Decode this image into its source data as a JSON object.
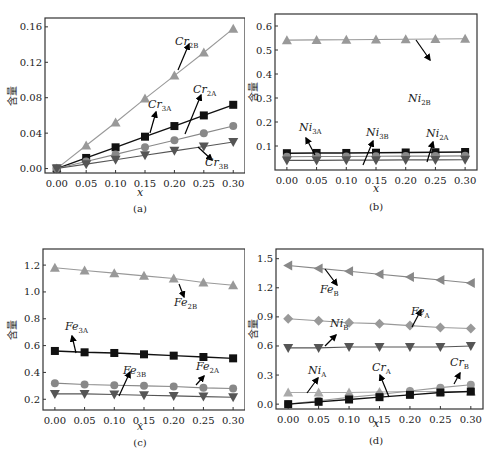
{
  "chart_data": [
    {
      "panel": "(a)",
      "type": "line",
      "xlabel": "x",
      "ylabel": "含量",
      "x": [
        0.0,
        0.05,
        0.1,
        0.15,
        0.2,
        0.25,
        0.3
      ],
      "ylim": [
        -0.005,
        0.17
      ],
      "yticks": [
        0.0,
        0.04,
        0.08,
        0.12,
        0.16
      ],
      "series": [
        {
          "name": "Cr2B",
          "marker": "triangle-up",
          "color": "#999999",
          "values": [
            0.0,
            0.026,
            0.052,
            0.079,
            0.105,
            0.131,
            0.158
          ]
        },
        {
          "name": "Cr3A",
          "marker": "square",
          "color": "#111111",
          "values": [
            0.0,
            0.012,
            0.024,
            0.036,
            0.048,
            0.06,
            0.072
          ]
        },
        {
          "name": "Cr2A",
          "marker": "circle",
          "color": "#888888",
          "values": [
            0.0,
            0.008,
            0.016,
            0.024,
            0.032,
            0.04,
            0.048
          ]
        },
        {
          "name": "Cr3B",
          "marker": "triangle-down",
          "color": "#555555",
          "values": [
            0.0,
            0.005,
            0.01,
            0.015,
            0.02,
            0.025,
            0.03
          ]
        }
      ]
    },
    {
      "panel": "(b)",
      "type": "line",
      "xlabel": "x",
      "ylabel": "含量",
      "x": [
        0.0,
        0.05,
        0.1,
        0.15,
        0.2,
        0.25,
        0.3
      ],
      "ylim": [
        0.0,
        0.65
      ],
      "yticks": [
        0.1,
        0.2,
        0.3,
        0.4,
        0.5,
        0.6
      ],
      "series": [
        {
          "name": "Ni2B",
          "marker": "triangle-up",
          "color": "#999999",
          "values": [
            0.541,
            0.542,
            0.543,
            0.544,
            0.545,
            0.546,
            0.547
          ]
        },
        {
          "name": "Ni3A",
          "marker": "square",
          "color": "#111111",
          "values": [
            0.07,
            0.071,
            0.071,
            0.072,
            0.073,
            0.074,
            0.075
          ]
        },
        {
          "name": "Ni2A",
          "marker": "circle",
          "color": "#888888",
          "values": [
            0.055,
            0.056,
            0.056,
            0.057,
            0.058,
            0.058,
            0.059
          ]
        },
        {
          "name": "Ni3B",
          "marker": "triangle-down",
          "color": "#555555",
          "values": [
            0.04,
            0.04,
            0.041,
            0.041,
            0.042,
            0.042,
            0.043
          ]
        }
      ]
    },
    {
      "panel": "(c)",
      "type": "line",
      "xlabel": "x",
      "ylabel": "含量",
      "x": [
        0.0,
        0.05,
        0.1,
        0.15,
        0.2,
        0.25,
        0.3
      ],
      "ylim": [
        0.12,
        1.32
      ],
      "yticks": [
        0.2,
        0.4,
        0.6,
        0.8,
        1.0,
        1.2
      ],
      "series": [
        {
          "name": "Fe2B",
          "marker": "triangle-up",
          "color": "#999999",
          "values": [
            1.18,
            1.16,
            1.14,
            1.12,
            1.1,
            1.07,
            1.05
          ]
        },
        {
          "name": "Fe3A",
          "marker": "square",
          "color": "#111111",
          "values": [
            0.56,
            0.55,
            0.545,
            0.535,
            0.525,
            0.515,
            0.505
          ]
        },
        {
          "name": "Fe2A",
          "marker": "circle",
          "color": "#888888",
          "values": [
            0.32,
            0.31,
            0.305,
            0.3,
            0.295,
            0.285,
            0.28
          ]
        },
        {
          "name": "Fe3B",
          "marker": "triangle-down",
          "color": "#555555",
          "values": [
            0.24,
            0.24,
            0.235,
            0.23,
            0.225,
            0.22,
            0.215
          ]
        }
      ]
    },
    {
      "panel": "(d)",
      "type": "line",
      "xlabel": "x",
      "ylabel": "含量",
      "x": [
        0.0,
        0.05,
        0.1,
        0.15,
        0.2,
        0.25,
        0.3
      ],
      "ylim": [
        -0.05,
        1.6
      ],
      "yticks": [
        0.0,
        0.3,
        0.6,
        0.9,
        1.2,
        1.5
      ],
      "series": [
        {
          "name": "FeB",
          "marker": "triangle-left",
          "color": "#888888",
          "values": [
            1.43,
            1.4,
            1.37,
            1.34,
            1.31,
            1.28,
            1.25
          ]
        },
        {
          "name": "FeA",
          "marker": "diamond",
          "color": "#999999",
          "values": [
            0.88,
            0.86,
            0.84,
            0.83,
            0.81,
            0.79,
            0.78
          ]
        },
        {
          "name": "NiB",
          "marker": "triangle-down",
          "color": "#555555",
          "values": [
            0.58,
            0.58,
            0.59,
            0.59,
            0.59,
            0.59,
            0.6
          ]
        },
        {
          "name": "NiA",
          "marker": "triangle-up",
          "color": "#aaaaaa",
          "values": [
            0.12,
            0.12,
            0.12,
            0.125,
            0.13,
            0.13,
            0.13
          ]
        },
        {
          "name": "CrB",
          "marker": "circle",
          "color": "#999999",
          "values": [
            0.0,
            0.035,
            0.07,
            0.1,
            0.135,
            0.17,
            0.2
          ]
        },
        {
          "name": "CrA",
          "marker": "square",
          "color": "#111111",
          "values": [
            0.0,
            0.024,
            0.048,
            0.072,
            0.096,
            0.12,
            0.13
          ]
        }
      ]
    }
  ],
  "panels": {
    "a": {
      "caption": "(a)",
      "xlabel": "x",
      "ylabel": "含量",
      "labels": [
        {
          "base": "Cr",
          "sub": "2B"
        },
        {
          "base": "Cr",
          "sub": "3A"
        },
        {
          "base": "Cr",
          "sub": "2A"
        },
        {
          "base": "Cr",
          "sub": "3B"
        }
      ]
    },
    "b": {
      "caption": "(b)",
      "xlabel": "x",
      "ylabel": "含量",
      "labels": [
        {
          "base": "Ni",
          "sub": "2B"
        },
        {
          "base": "Ni",
          "sub": "3A"
        },
        {
          "base": "Ni",
          "sub": "3B"
        },
        {
          "base": "Ni",
          "sub": "2A"
        }
      ]
    },
    "c": {
      "caption": "(c)",
      "xlabel": "x",
      "ylabel": "含量",
      "labels": [
        {
          "base": "Fe",
          "sub": "2B"
        },
        {
          "base": "Fe",
          "sub": "3A"
        },
        {
          "base": "Fe",
          "sub": "3B"
        },
        {
          "base": "Fe",
          "sub": "2A"
        }
      ]
    },
    "d": {
      "caption": "(d)",
      "xlabel": "x",
      "ylabel": "含量",
      "labels": [
        {
          "base": "Fe",
          "sub": "B"
        },
        {
          "base": "Fe",
          "sub": "A"
        },
        {
          "base": "Ni",
          "sub": "B"
        },
        {
          "base": "Ni",
          "sub": "A"
        },
        {
          "base": "Cr",
          "sub": "A"
        },
        {
          "base": "Cr",
          "sub": "B"
        }
      ]
    }
  }
}
